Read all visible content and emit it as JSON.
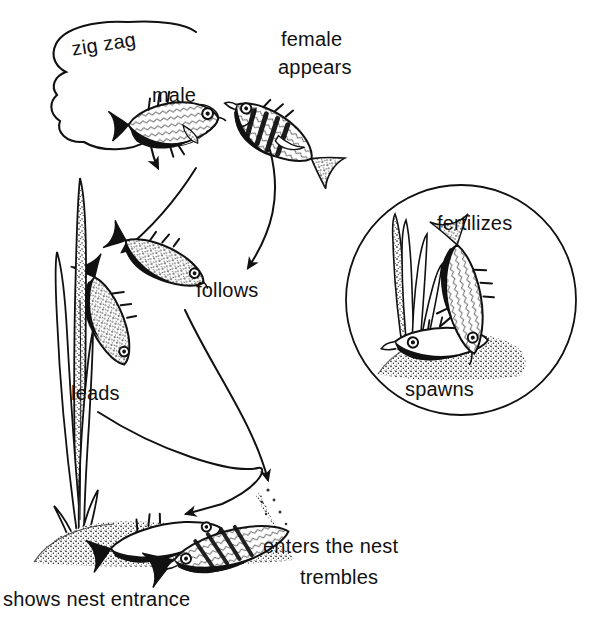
{
  "figure": {
    "kind": "three-spined stickleback courtship sequence diagram",
    "background_color": "#ffffff",
    "ink_color": "#111111"
  },
  "speech_bubble": {
    "text": "zig zag",
    "shape": "cloud-callout",
    "tail_direction": "down-right toward male fish"
  },
  "labels": {
    "male": "male",
    "female": "female",
    "appears": "appears",
    "follows": "follows",
    "leads": "leads",
    "enters_the_nest": "enters the nest",
    "trembles": "trembles",
    "shows_nest_entrance": "shows nest entrance"
  },
  "inset": {
    "shape": "circle",
    "fertilizes": "fertilizes",
    "spawns": "spawns"
  },
  "icons": {
    "male_fish": "stickleback-fish-icon",
    "female_fish": "stickleback-fish-icon",
    "following_fish": "stickleback-fish-icon",
    "leading_fish": "stickleback-fish-icon",
    "nest_fish": "stickleback-fish-icon",
    "nest": "nest-mound-icon",
    "plants": "water-weed-icon",
    "arrow": "curved-arrow-icon"
  }
}
